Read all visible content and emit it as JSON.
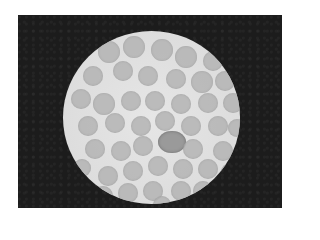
{
  "image": {
    "subject": "microscope field of view with round cells",
    "frame_color": "#1c1c1c",
    "field_color": "#e0e0e0",
    "cell_color": "#b4b4b4",
    "cells": [
      [
        35,
        10,
        11
      ],
      [
        60,
        5,
        11
      ],
      [
        88,
        8,
        11
      ],
      [
        112,
        15,
        11
      ],
      [
        140,
        20,
        10
      ],
      [
        20,
        35,
        10
      ],
      [
        50,
        30,
        10
      ],
      [
        75,
        35,
        10
      ],
      [
        103,
        38,
        10
      ],
      [
        128,
        40,
        11
      ],
      [
        152,
        40,
        10
      ],
      [
        8,
        58,
        10
      ],
      [
        30,
        62,
        11
      ],
      [
        58,
        60,
        10
      ],
      [
        82,
        60,
        10
      ],
      [
        108,
        63,
        10
      ],
      [
        135,
        62,
        10
      ],
      [
        160,
        62,
        10
      ],
      [
        15,
        85,
        10
      ],
      [
        42,
        82,
        10
      ],
      [
        68,
        85,
        10
      ],
      [
        92,
        80,
        10
      ],
      [
        118,
        85,
        10
      ],
      [
        145,
        85,
        10
      ],
      [
        165,
        88,
        9
      ],
      [
        22,
        108,
        10
      ],
      [
        48,
        110,
        10
      ],
      [
        70,
        105,
        10
      ],
      [
        95,
        100,
        14,
        "dark"
      ],
      [
        120,
        108,
        10
      ],
      [
        150,
        110,
        10
      ],
      [
        10,
        128,
        9
      ],
      [
        35,
        135,
        10
      ],
      [
        60,
        130,
        10
      ],
      [
        85,
        125,
        10
      ],
      [
        110,
        128,
        10
      ],
      [
        135,
        128,
        10
      ],
      [
        158,
        132,
        9
      ],
      [
        30,
        155,
        10
      ],
      [
        55,
        152,
        10
      ],
      [
        80,
        150,
        10
      ],
      [
        108,
        150,
        10
      ],
      [
        130,
        150,
        10
      ],
      [
        90,
        165,
        9
      ]
    ]
  }
}
